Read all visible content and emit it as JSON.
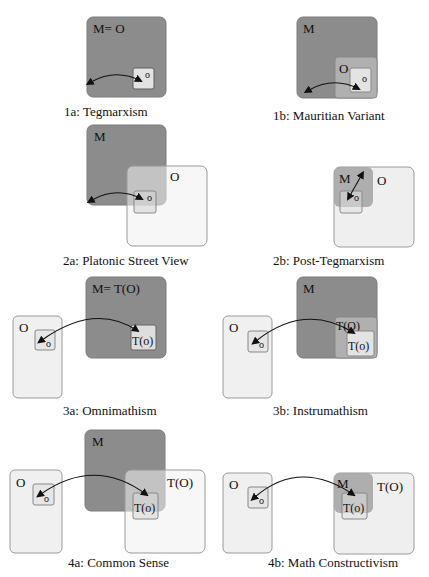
{
  "colors": {
    "math_box": "#8c8c8c",
    "math_box_stroke": "#7d7d7d",
    "observable_box": "#f1f1f1",
    "observable_box_stroke": "#9a9a9a",
    "small_box": "#e6e6e6",
    "small_box_stroke": "#888888",
    "overlap_mid": "#b8b8b8",
    "arrow": "#111111"
  },
  "panels": [
    {
      "id": "1a",
      "caption": "1a: Tegmarxism",
      "labels": {
        "big": "M= O",
        "small": "o"
      }
    },
    {
      "id": "1b",
      "caption": "1b: Mauritian Variant",
      "labels": {
        "big": "M",
        "mid": "O",
        "small": "o"
      }
    },
    {
      "id": "2a",
      "caption": "2a: Platonic Street View",
      "labels": {
        "big": "M",
        "other": "O",
        "small": "o"
      }
    },
    {
      "id": "2b",
      "caption": "2b: Post-Tegmarxism",
      "labels": {
        "big": "M",
        "other": "O",
        "small": "o"
      }
    },
    {
      "id": "3a",
      "caption": "3a: Omnimathism",
      "labels": {
        "left_big": "O",
        "left_small": "o",
        "big": "M= T(O)",
        "small": "T(o)"
      }
    },
    {
      "id": "3b",
      "caption": "3b: Instrumathism",
      "labels": {
        "left_big": "O",
        "left_small": "o",
        "big": "M",
        "mid": "T(O)",
        "small": "T(o)"
      }
    },
    {
      "id": "4a",
      "caption": "4a: Common Sense",
      "labels": {
        "left_big": "O",
        "left_small": "o",
        "big": "M",
        "other": "T(O)",
        "small": "T(o)"
      }
    },
    {
      "id": "4b",
      "caption": "4b: Math Constructivism",
      "labels": {
        "left_big": "O",
        "left_small": "o",
        "big": "M",
        "other": "T(O)",
        "small": "T(o)"
      }
    }
  ]
}
